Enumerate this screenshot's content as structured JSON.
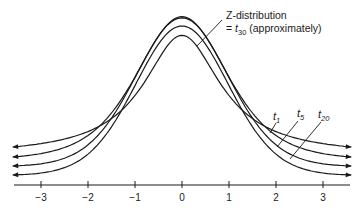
{
  "chart_data": {
    "type": "line",
    "title": "",
    "xlabel": "",
    "ylabel": "",
    "xlim": [
      -3.5,
      3.7
    ],
    "x_ticks": [
      -3,
      -2,
      -1,
      0,
      1,
      2,
      3
    ],
    "x_tick_labels": [
      "−3",
      "−2",
      "−1",
      "0",
      "1",
      "2",
      "3"
    ],
    "grid": false,
    "y_axis_shown": false,
    "axis_arrows": "curves extend with arrowheads at both ends",
    "series": [
      {
        "name": "t1",
        "label_base": "t",
        "label_sub": "1",
        "df": 1,
        "peak_density": 0.318
      },
      {
        "name": "t5",
        "label_base": "t",
        "label_sub": "5",
        "df": 5,
        "peak_density": 0.38
      },
      {
        "name": "t20",
        "label_base": "t",
        "label_sub": "20",
        "df": 20,
        "peak_density": 0.394
      },
      {
        "name": "Z-distribution",
        "df": 30,
        "peak_density": 0.399
      }
    ],
    "annotations": [
      {
        "text_line1": "Z-distribution",
        "text_line2_prefix": "= ",
        "text_line2_base": "t",
        "text_line2_sub": "30",
        "text_line2_suffix": " (approximately)",
        "points_to": "Z-distribution peak"
      },
      {
        "text": "t1",
        "points_to": "t1 right tail"
      },
      {
        "text": "t5",
        "points_to": "t5 right tail"
      },
      {
        "text": "t20",
        "points_to": "t20 right tail"
      }
    ]
  },
  "labels": {
    "z_line1": "Z-distribution",
    "z_line2_prefix": "= ",
    "z_line2_base": "t",
    "z_line2_sub": "30",
    "z_line2_suffix": " (approximately)",
    "t1_base": "t",
    "t1_sub": "1",
    "t5_base": "t",
    "t5_sub": "5",
    "t20_base": "t",
    "t20_sub": "20"
  },
  "colors": {
    "ink": "#1a1a1a",
    "background": "#ffffff"
  }
}
